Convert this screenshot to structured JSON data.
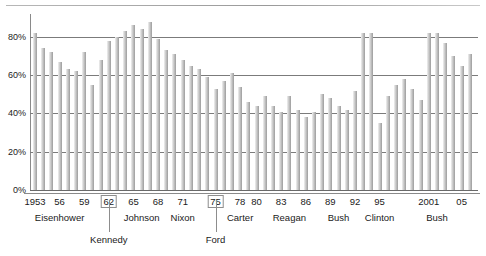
{
  "chart_data": {
    "type": "bar",
    "title": "",
    "subtitle": "",
    "xlabel": "",
    "ylabel": "",
    "ylim": [
      0,
      92
    ],
    "grid": true,
    "legend": null,
    "y_ticks": [
      "0%",
      "20%",
      "40%",
      "60%",
      "80%"
    ],
    "y_tick_values": [
      0,
      20,
      40,
      60,
      80
    ],
    "x_tick_labels": [
      "1953",
      "56",
      "59",
      "62",
      "65",
      "68",
      "71",
      "75",
      "78",
      "80",
      "83",
      "86",
      "89",
      "92",
      "95",
      "2001",
      "05"
    ],
    "x_boxed_ticks": [
      "62",
      "75"
    ],
    "group_labels": [
      "Eisenhower",
      "Kennedy",
      "Johnson",
      "Nixon",
      "Ford",
      "Carter",
      "Reagan",
      "Bush",
      "Clinton",
      "Bush"
    ],
    "x": [
      1953,
      1954,
      1955,
      1956,
      1957,
      1958,
      1959,
      1960,
      1961,
      1962,
      1963,
      1964,
      1965,
      1966,
      1967,
      1968,
      1969,
      1970,
      1971,
      1972,
      1973,
      1974,
      1975,
      1976,
      1977,
      1978,
      1979,
      1980,
      1981,
      1982,
      1983,
      1984,
      1985,
      1986,
      1987,
      1988,
      1989,
      1990,
      1991,
      1992,
      1993,
      1994,
      1995,
      1996,
      1997,
      1998,
      1999,
      2000,
      2001,
      2002,
      2003,
      2004,
      2005,
      2006
    ],
    "categories": [
      "1953",
      "1954",
      "1955",
      "1956",
      "1957",
      "1958",
      "1959",
      "1960",
      "1961",
      "1962",
      "1963",
      "1964",
      "1965",
      "1966",
      "1967",
      "1968",
      "1969",
      "1970",
      "1971",
      "1972",
      "1973",
      "1974",
      "1975",
      "1976",
      "1977",
      "1978",
      "1979",
      "1980",
      "1981",
      "1982",
      "1983",
      "1984",
      "1985",
      "1986",
      "1987",
      "1988",
      "1989",
      "1990",
      "1991",
      "1992",
      "1993",
      "1994",
      "1995",
      "1996",
      "1997",
      "1998",
      "1999",
      "2000",
      "2001",
      "2002",
      "2003",
      "2004",
      "2005",
      "2006"
    ],
    "values": [
      82,
      74,
      72,
      67,
      63,
      62,
      72,
      55,
      68,
      78,
      80,
      83,
      86,
      84,
      88,
      79,
      73,
      71,
      68,
      65,
      63,
      59,
      53,
      57,
      61,
      54,
      46,
      44,
      49,
      44,
      41,
      49,
      42,
      38,
      41,
      50,
      48,
      44,
      42,
      52,
      82,
      82,
      35,
      49,
      55,
      58,
      53,
      47,
      82,
      82,
      77,
      70,
      65,
      71
    ],
    "values_note": "percent",
    "accent_colors": {
      "bar_light": "#f2f2f2",
      "bar_mid": "#bdbdbd",
      "bar_dark": "#9b9b9b",
      "gridline": "#7b7b7b",
      "axis": "#8a8a8a",
      "text": "#1a1a1a"
    }
  }
}
